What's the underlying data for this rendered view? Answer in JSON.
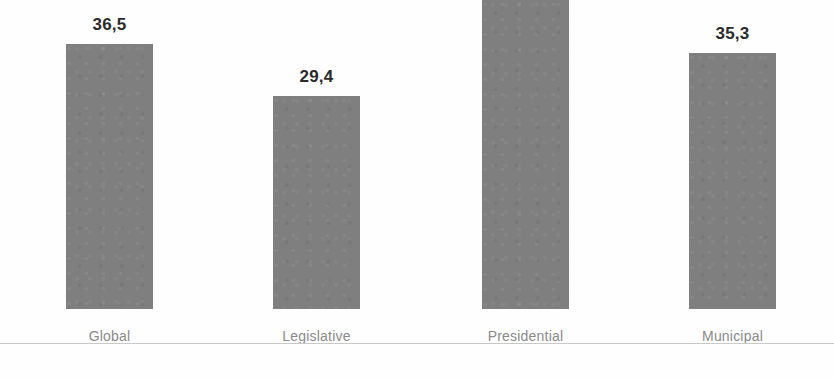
{
  "chart_data": {
    "type": "bar",
    "title": "",
    "subtitle": "",
    "xlabel": "",
    "ylabel": "",
    "categories": [
      "Global",
      "Legislative",
      "Presidential",
      "Municipal"
    ],
    "values": [
      36.5,
      29.4,
      42.6,
      35.3
    ],
    "value_labels": [
      "36,5",
      "29,4",
      "42,6",
      "35,3"
    ],
    "decimal_separator": ",",
    "ylim": [
      0,
      42.6
    ],
    "grid": false,
    "legend": false,
    "legend_position": "none",
    "axis_visible": {
      "x": true,
      "y": false
    },
    "bars": [
      {
        "category": "Global",
        "value": 36.5,
        "label": "36,5"
      },
      {
        "category": "Legislative",
        "value": 29.4,
        "label": "29,4"
      },
      {
        "category": "Presidential",
        "value": 42.6,
        "label": "42,6"
      },
      {
        "category": "Municipal",
        "value": 35.3,
        "label": "35,3"
      }
    ],
    "colors": {
      "bar_fill": "#7f7f7f",
      "value_label": "#2b2b2b",
      "category_label": "#8a8a8a",
      "axis_line": "#c9c9c9",
      "background": "#fefefe"
    }
  }
}
